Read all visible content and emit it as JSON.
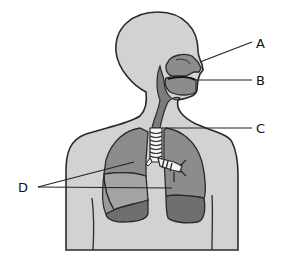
{
  "diagram": {
    "labels": [
      {
        "id": "A",
        "text": "A"
      },
      {
        "id": "B",
        "text": "B"
      },
      {
        "id": "C",
        "text": "C"
      },
      {
        "id": "D",
        "text": "D"
      }
    ],
    "colors": {
      "background": "#ffffff",
      "body": "#d2d2d2",
      "outline": "#2a2a2a",
      "lung": "#8c8c8c",
      "lung_middle": "#a3a3a3",
      "lung_lower": "#6f6f6f",
      "airway": "#7c7c7c",
      "trachea_rings": "#f4f4f4",
      "leader_line": "#222222"
    }
  }
}
